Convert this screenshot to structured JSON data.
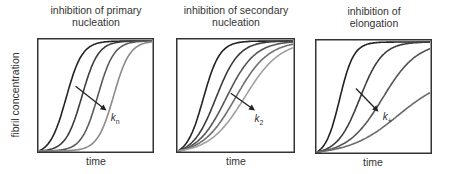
{
  "chart_data": [
    {
      "type": "line",
      "title": "inhibition of primary nucleation",
      "title_lines": [
        "inhibition of primary",
        "nucleation"
      ],
      "xlabel": "time",
      "ylabel": "fibril concentration",
      "arrow_label": "k",
      "arrow_label_sub": "n",
      "grid": false,
      "series": [
        {
          "name": "curve 1",
          "color": "#222222",
          "midpoint": 0.24,
          "steepness": 14
        },
        {
          "name": "curve 2",
          "color": "#3d3d3d",
          "midpoint": 0.38,
          "steepness": 14
        },
        {
          "name": "curve 3",
          "color": "#5a5a5a",
          "midpoint": 0.52,
          "steepness": 14
        },
        {
          "name": "curve 4",
          "color": "#8a8a8a",
          "midpoint": 0.66,
          "steepness": 14
        }
      ]
    },
    {
      "type": "line",
      "title": "inhibition of secondary nucleation",
      "title_lines": [
        "inhibition of secondary",
        "nucleation"
      ],
      "xlabel": "time",
      "ylabel": "",
      "arrow_label": "k",
      "arrow_label_sub": "2",
      "grid": false,
      "series": [
        {
          "name": "curve 1",
          "color": "#222222",
          "midpoint": 0.22,
          "steepness": 14
        },
        {
          "name": "curve 2",
          "color": "#3d3d3d",
          "midpoint": 0.33,
          "steepness": 10
        },
        {
          "name": "curve 3",
          "color": "#555555",
          "midpoint": 0.42,
          "steepness": 8
        },
        {
          "name": "curve 4",
          "color": "#6e6e6e",
          "midpoint": 0.5,
          "steepness": 7
        },
        {
          "name": "curve 5",
          "color": "#a0a0a0",
          "midpoint": 0.58,
          "steepness": 6.5
        }
      ]
    },
    {
      "type": "line",
      "title": "inhibition of elongation",
      "title_lines": [
        "inhibition of",
        "elongation"
      ],
      "xlabel": "time",
      "ylabel": "",
      "arrow_label": "k",
      "arrow_label_sub": "+",
      "grid": false,
      "series": [
        {
          "name": "curve 1",
          "color": "#222222",
          "midpoint": 0.2,
          "steepness": 16
        },
        {
          "name": "curve 2",
          "color": "#3d3d3d",
          "midpoint": 0.38,
          "steepness": 10
        },
        {
          "name": "curve 3",
          "color": "#555555",
          "midpoint": 0.58,
          "steepness": 6.5
        },
        {
          "name": "curve 4",
          "color": "#6a6a6a",
          "midpoint": 1.02,
          "steepness": 4.6
        }
      ]
    }
  ],
  "figure": {
    "panels": [
      {
        "box": [
          37,
          38,
          117,
          115
        ],
        "title_y": 5,
        "arrow": [
          0.33,
          0.42,
          0.58,
          0.62
        ],
        "label_pos": [
          0.63,
          0.72
        ]
      },
      {
        "box": [
          176,
          38,
          119,
          115
        ],
        "title_y": 5,
        "arrow": [
          0.46,
          0.48,
          0.65,
          0.62
        ],
        "label_pos": [
          0.66,
          0.73
        ]
      },
      {
        "box": [
          315,
          39,
          117,
          115
        ],
        "title_y": 5,
        "arrow": [
          0.35,
          0.43,
          0.53,
          0.62
        ],
        "label_pos": [
          0.58,
          0.7
        ]
      }
    ]
  }
}
